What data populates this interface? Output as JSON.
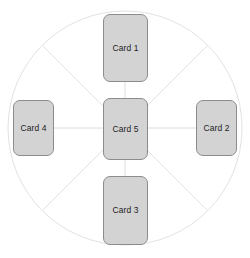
{
  "diagram": {
    "type": "radial-hub-and-spoke",
    "colors": {
      "card_fill": "#d3d3d3",
      "card_border": "#8c8c8c",
      "circle_stroke": "#e2e2e2",
      "spoke_stroke": "#e2e2e2",
      "connector_stroke": "#dcdcdc",
      "label_text": "#1d1d1d",
      "background": "#ffffff"
    },
    "circle": {
      "center_x": 125,
      "center_y": 128,
      "radius": 117
    },
    "cards": [
      {
        "id": "card-1",
        "label": "Card 1",
        "position": "top"
      },
      {
        "id": "card-2",
        "label": "Card 2",
        "position": "right"
      },
      {
        "id": "card-3",
        "label": "Card 3",
        "position": "bottom"
      },
      {
        "id": "card-4",
        "label": "Card 4",
        "position": "left"
      },
      {
        "id": "card-5",
        "label": "Card 5",
        "position": "center"
      }
    ]
  }
}
